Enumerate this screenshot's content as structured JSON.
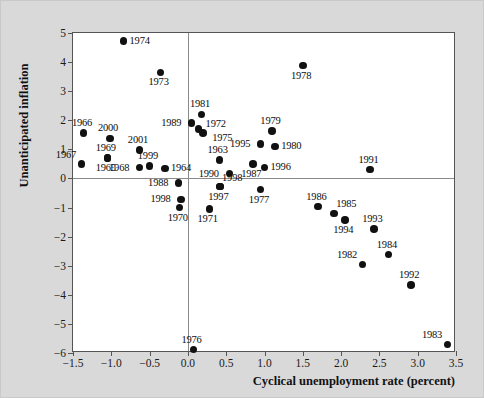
{
  "chart_data": {
    "type": "scatter",
    "title": "",
    "xlabel": "Cyclical unemployment rate (percent)",
    "ylabel": "Unanticipated inflation",
    "xlim": [
      -1.5,
      3.5
    ],
    "ylim": [
      -6,
      5
    ],
    "xticks": [
      "-1.5",
      "-1.0",
      "-0.5",
      "0.0",
      "0.5",
      "1.0",
      "1.5",
      "2.0",
      "2.5",
      "3.0",
      "3.5"
    ],
    "xtick_values": [
      -1.5,
      -1.0,
      -0.5,
      0.0,
      0.5,
      1.0,
      1.5,
      2.0,
      2.5,
      3.0,
      3.5
    ],
    "yticks": [
      "5",
      "4",
      "3",
      "2",
      "1",
      "0",
      "-1",
      "-2",
      "-3",
      "-4",
      "-5",
      "-6"
    ],
    "ytick_values": [
      5,
      4,
      3,
      2,
      1,
      0,
      -1,
      -2,
      -3,
      -4,
      -5,
      -6
    ],
    "grid": false,
    "legend": "none",
    "marker_color": "#111111",
    "plot_background": "#ffffff",
    "figure_background": "#d9d9d9",
    "axis_color": "#555555",
    "zero_line_color": "#8a8a8a",
    "points": [
      {
        "label": "1974",
        "x": -0.84,
        "y": 4.72,
        "label_pos": "right"
      },
      {
        "label": "1973",
        "x": -0.36,
        "y": 3.65,
        "label_pos": "below"
      },
      {
        "label": "1978",
        "x": 1.5,
        "y": 3.88,
        "label_pos": "below"
      },
      {
        "label": "1981",
        "x": 0.18,
        "y": 2.2,
        "label_pos": "above"
      },
      {
        "label": "1966",
        "x": -1.36,
        "y": 1.57,
        "label_pos": "above"
      },
      {
        "label": "1989",
        "x": 0.05,
        "y": 1.9,
        "label_pos": "left"
      },
      {
        "label": "1972",
        "x": 0.14,
        "y": 1.7,
        "label_pos": "right-up"
      },
      {
        "label": "1975",
        "x": 0.2,
        "y": 1.57,
        "label_pos": "right-down"
      },
      {
        "label": "1979",
        "x": 1.1,
        "y": 1.63,
        "label_pos": "above"
      },
      {
        "label": "2000",
        "x": -1.02,
        "y": 1.38,
        "label_pos": "above"
      },
      {
        "label": "1995",
        "x": 0.95,
        "y": 1.18,
        "label_pos": "left"
      },
      {
        "label": "1980",
        "x": 1.14,
        "y": 1.1,
        "label_pos": "right"
      },
      {
        "label": "2001",
        "x": -0.63,
        "y": 0.98,
        "label_pos": "above"
      },
      {
        "label": "1969",
        "x": -1.05,
        "y": 0.7,
        "label_pos": "above"
      },
      {
        "label": "1963",
        "x": 0.41,
        "y": 0.63,
        "label_pos": "above"
      },
      {
        "label": "1991",
        "x": 2.38,
        "y": 0.3,
        "label_pos": "above"
      },
      {
        "label": "1967",
        "x": -1.39,
        "y": 0.49,
        "label_pos": "above-left"
      },
      {
        "label": "1965",
        "x": -1.05,
        "y": 0.7,
        "label_pos": "below"
      },
      {
        "label": "1968",
        "x": -0.63,
        "y": 0.37,
        "label_pos": "left"
      },
      {
        "label": "1999",
        "x": -0.5,
        "y": 0.43,
        "label_pos": "above"
      },
      {
        "label": "1987",
        "x": 0.85,
        "y": 0.5,
        "label_pos": "below"
      },
      {
        "label": "1996",
        "x": 1.0,
        "y": 0.38,
        "label_pos": "right"
      },
      {
        "label": "1964",
        "x": -0.3,
        "y": 0.35,
        "label_pos": "right"
      },
      {
        "label": "1990",
        "x": 0.54,
        "y": 0.17,
        "label_pos": "left"
      },
      {
        "label": "1988",
        "x": -0.12,
        "y": -0.15,
        "label_pos": "left"
      },
      {
        "label": "1997",
        "x": 0.42,
        "y": -0.28,
        "label_pos": "below"
      },
      {
        "label": "1998",
        "x": 0.42,
        "y": -0.28,
        "label_pos": "above-right"
      },
      {
        "label": "1998",
        "x": -0.09,
        "y": -0.72,
        "label_pos": "left"
      },
      {
        "label": "1977",
        "x": 0.95,
        "y": -0.38,
        "label_pos": "below"
      },
      {
        "label": "1970",
        "x": -0.11,
        "y": -1.0,
        "label_pos": "below"
      },
      {
        "label": "1971",
        "x": 0.28,
        "y": -1.05,
        "label_pos": "below"
      },
      {
        "label": "1986",
        "x": 1.7,
        "y": -0.97,
        "label_pos": "above"
      },
      {
        "label": "1985",
        "x": 1.91,
        "y": -1.2,
        "label_pos": "above-right"
      },
      {
        "label": "1994",
        "x": 2.05,
        "y": -1.42,
        "label_pos": "below"
      },
      {
        "label": "1993",
        "x": 2.43,
        "y": -1.73,
        "label_pos": "above"
      },
      {
        "label": "1984",
        "x": 2.62,
        "y": -2.62,
        "label_pos": "above"
      },
      {
        "label": "1982",
        "x": 2.28,
        "y": -2.95,
        "label_pos": "above-left"
      },
      {
        "label": "1992",
        "x": 2.91,
        "y": -3.67,
        "label_pos": "above"
      },
      {
        "label": "1976",
        "x": 0.07,
        "y": -5.88,
        "label_pos": "above"
      },
      {
        "label": "1983",
        "x": 3.39,
        "y": -5.7,
        "label_pos": "above-left"
      }
    ]
  }
}
